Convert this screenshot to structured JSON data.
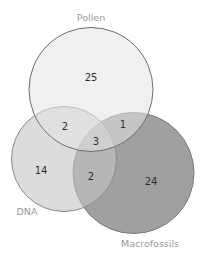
{
  "diagram": {
    "type": "venn-3",
    "sets": [
      {
        "id": "pollen",
        "label": "Pollen",
        "fill": "#d6d6d6",
        "stroke": "#7a7a7a"
      },
      {
        "id": "dna",
        "label": "DNA",
        "fill": "#bdbdbd",
        "stroke": "#8a8a8a"
      },
      {
        "id": "macrofossils",
        "label": "Macrofossils",
        "fill": "#8f8f8f",
        "stroke": "#7a7a7a"
      }
    ],
    "regions": {
      "pollen_only": "25",
      "dna_only": "14",
      "macrofossils_only": "24",
      "pollen_dna": "2",
      "pollen_macrofossils": "1",
      "dna_macrofossils": "2",
      "all_three": "3"
    }
  }
}
